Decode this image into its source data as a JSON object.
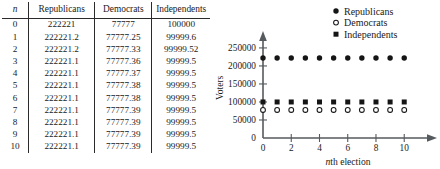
{
  "table": {
    "columns": [
      "n",
      "Republicans",
      "Democrats",
      "Independents"
    ],
    "rows": [
      [
        "0",
        "222221",
        "77777",
        "100000"
      ],
      [
        "1",
        "222221.2",
        "77777.25",
        "99999.6"
      ],
      [
        "2",
        "222221.2",
        "77777.33",
        "99999.52"
      ],
      [
        "3",
        "222221.1",
        "77777.36",
        "99999.5"
      ],
      [
        "4",
        "222221.1",
        "77777.37",
        "99999.5"
      ],
      [
        "5",
        "222221.1",
        "77777.38",
        "99999.5"
      ],
      [
        "6",
        "222221.1",
        "77777.38",
        "99999.5"
      ],
      [
        "7",
        "222221.1",
        "77777.39",
        "99999.5"
      ],
      [
        "8",
        "222221.1",
        "77777.39",
        "99999.5"
      ],
      [
        "9",
        "222221.1",
        "77777.39",
        "99999.5"
      ],
      [
        "10",
        "222221.1",
        "77777.39",
        "99999.5"
      ]
    ]
  },
  "chart_data": {
    "type": "scatter",
    "title": "",
    "xlabel": "nth election",
    "ylabel": "Voters",
    "x": [
      0,
      1,
      2,
      3,
      4,
      5,
      6,
      7,
      8,
      9,
      10
    ],
    "xlim": [
      0,
      11.4
    ],
    "ylim": [
      0,
      272000
    ],
    "xticks": [
      0,
      2,
      4,
      6,
      8,
      10
    ],
    "xticklabels": [
      "0",
      "2",
      "4",
      "6",
      "8",
      "10"
    ],
    "yticks": [
      0,
      50000,
      100000,
      150000,
      200000,
      250000
    ],
    "yticklabels": [
      "0",
      "50000",
      "100000",
      "150000",
      "200000",
      "250000"
    ],
    "grid": false,
    "legend_position": "top-right",
    "series": [
      {
        "name": "Republicans",
        "marker": "filled-circle",
        "color": "#151515",
        "values": [
          222221,
          222221.2,
          222221.2,
          222221.1,
          222221.1,
          222221.1,
          222221.1,
          222221.1,
          222221.1,
          222221.1,
          222221.1
        ]
      },
      {
        "name": "Democrats",
        "marker": "open-circle",
        "color": "#151515",
        "values": [
          77777,
          77777.25,
          77777.33,
          77777.36,
          77777.37,
          77777.38,
          77777.38,
          77777.39,
          77777.39,
          77777.39,
          77777.39
        ]
      },
      {
        "name": "Independents",
        "marker": "filled-square",
        "color": "#151515",
        "values": [
          100000,
          99999.6,
          99999.52,
          99999.5,
          99999.5,
          99999.5,
          99999.5,
          99999.5,
          99999.5,
          99999.5,
          99999.5
        ]
      }
    ]
  }
}
